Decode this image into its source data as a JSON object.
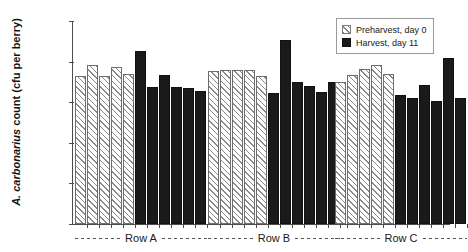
{
  "chart_data": {
    "type": "bar",
    "title": "",
    "xlabel": "",
    "ylabel": "A. carbonarius count (cfu per berry)",
    "ylabel_italic_part": "A. carbonarius",
    "ylabel_roman_part": " count (cfu per berry)",
    "yscale": "log",
    "ylim": [
      1,
      100000
    ],
    "ytick_labels": [
      "100,000",
      "10,000",
      "1,000",
      "100",
      "10",
      "1"
    ],
    "ytick_values": [
      100000,
      10000,
      1000,
      100,
      10,
      1
    ],
    "grid": false,
    "legend_position": "top-right",
    "categories": [
      "Row A",
      "Row B",
      "Row C"
    ],
    "series": [
      {
        "name": "Preharvest, day 0",
        "fill": "hatched",
        "color": "#ffffff",
        "hatch_color": "#8a8a8a",
        "values_by_group": {
          "Row A": [
            4400,
            8400,
            4300,
            7400,
            4900
          ],
          "Row B": [
            5900,
            6300,
            6300,
            6300,
            4400
          ],
          "Row C": [
            3200,
            4700,
            6600,
            8200,
            4900
          ]
        }
      },
      {
        "name": "Harvest, day 11",
        "fill": "solid",
        "color": "#1a1a1a",
        "values_by_group": {
          "Row A": [
            18000,
            2400,
            4800,
            2400,
            2300,
            1850
          ],
          "Row B": [
            1700,
            34000,
            3100,
            2500,
            1800,
            3100
          ],
          "Row C": [
            1500,
            1300,
            2700,
            1050,
            12000,
            1300
          ]
        }
      }
    ],
    "bars": [
      {
        "group": "Row A",
        "series": "Preharvest, day 0",
        "index": 0,
        "value": 4400
      },
      {
        "group": "Row A",
        "series": "Preharvest, day 0",
        "index": 1,
        "value": 8400
      },
      {
        "group": "Row A",
        "series": "Preharvest, day 0",
        "index": 2,
        "value": 4300
      },
      {
        "group": "Row A",
        "series": "Preharvest, day 0",
        "index": 3,
        "value": 7400
      },
      {
        "group": "Row A",
        "series": "Preharvest, day 0",
        "index": 4,
        "value": 4900
      },
      {
        "group": "Row A",
        "series": "Harvest, day 11",
        "index": 0,
        "value": 18000
      },
      {
        "group": "Row A",
        "series": "Harvest, day 11",
        "index": 1,
        "value": 2400
      },
      {
        "group": "Row A",
        "series": "Harvest, day 11",
        "index": 2,
        "value": 4800
      },
      {
        "group": "Row A",
        "series": "Harvest, day 11",
        "index": 3,
        "value": 2400
      },
      {
        "group": "Row A",
        "series": "Harvest, day 11",
        "index": 4,
        "value": 2300
      },
      {
        "group": "Row A",
        "series": "Harvest, day 11",
        "index": 5,
        "value": 1850
      },
      {
        "group": "Row B",
        "series": "Preharvest, day 0",
        "index": 0,
        "value": 5900
      },
      {
        "group": "Row B",
        "series": "Preharvest, day 0",
        "index": 1,
        "value": 6300
      },
      {
        "group": "Row B",
        "series": "Preharvest, day 0",
        "index": 2,
        "value": 6300
      },
      {
        "group": "Row B",
        "series": "Preharvest, day 0",
        "index": 3,
        "value": 6300
      },
      {
        "group": "Row B",
        "series": "Preharvest, day 0",
        "index": 4,
        "value": 4400
      },
      {
        "group": "Row B",
        "series": "Harvest, day 11",
        "index": 0,
        "value": 1700
      },
      {
        "group": "Row B",
        "series": "Harvest, day 11",
        "index": 1,
        "value": 34000
      },
      {
        "group": "Row B",
        "series": "Harvest, day 11",
        "index": 2,
        "value": 3100
      },
      {
        "group": "Row B",
        "series": "Harvest, day 11",
        "index": 3,
        "value": 2500
      },
      {
        "group": "Row B",
        "series": "Harvest, day 11",
        "index": 4,
        "value": 1800
      },
      {
        "group": "Row B",
        "series": "Harvest, day 11",
        "index": 5,
        "value": 3100
      },
      {
        "group": "Row C",
        "series": "Preharvest, day 0",
        "index": 0,
        "value": 3200
      },
      {
        "group": "Row C",
        "series": "Preharvest, day 0",
        "index": 1,
        "value": 4700
      },
      {
        "group": "Row C",
        "series": "Preharvest, day 0",
        "index": 2,
        "value": 6600
      },
      {
        "group": "Row C",
        "series": "Preharvest, day 0",
        "index": 3,
        "value": 8200
      },
      {
        "group": "Row C",
        "series": "Preharvest, day 0",
        "index": 4,
        "value": 4900
      },
      {
        "group": "Row C",
        "series": "Harvest, day 11",
        "index": 0,
        "value": 1500
      },
      {
        "group": "Row C",
        "series": "Harvest, day 11",
        "index": 1,
        "value": 1300
      },
      {
        "group": "Row C",
        "series": "Harvest, day 11",
        "index": 2,
        "value": 2700
      },
      {
        "group": "Row C",
        "series": "Harvest, day 11",
        "index": 3,
        "value": 1050
      },
      {
        "group": "Row C",
        "series": "Harvest, day 11",
        "index": 4,
        "value": 12000
      },
      {
        "group": "Row C",
        "series": "Harvest, day 11",
        "index": 5,
        "value": 1300
      }
    ]
  },
  "axis": {
    "y_title_italic": "A. carbonarius",
    "y_title_rest": " count (cfu per berry)",
    "ticks": [
      {
        "label": "100,000",
        "value": 100000
      },
      {
        "label": "10,000",
        "value": 10000
      },
      {
        "label": "1,000",
        "value": 1000
      },
      {
        "label": "100",
        "value": 100
      },
      {
        "label": "10",
        "value": 10
      },
      {
        "label": "1",
        "value": 1
      }
    ]
  },
  "legend": {
    "entries": [
      {
        "label": "Preharvest, day 0",
        "style": "hatched"
      },
      {
        "label": "Harvest, day 11",
        "style": "solid"
      }
    ]
  },
  "groups": [
    {
      "label": "Row A"
    },
    {
      "label": "Row B"
    },
    {
      "label": "Row C"
    }
  ]
}
